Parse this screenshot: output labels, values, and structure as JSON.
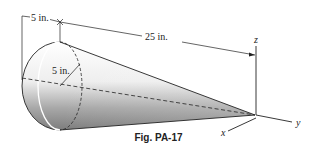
{
  "figure": {
    "caption": "Fig. PA-17",
    "dimensions": {
      "offset": "5 in.",
      "length": "25 in.",
      "radius": "5 in."
    },
    "axes": {
      "x": "x",
      "y": "y",
      "z": "z"
    },
    "colors": {
      "line": "#222222",
      "shade_dark": "#8a8a8a",
      "shade_light": "#f4f4f4"
    }
  }
}
